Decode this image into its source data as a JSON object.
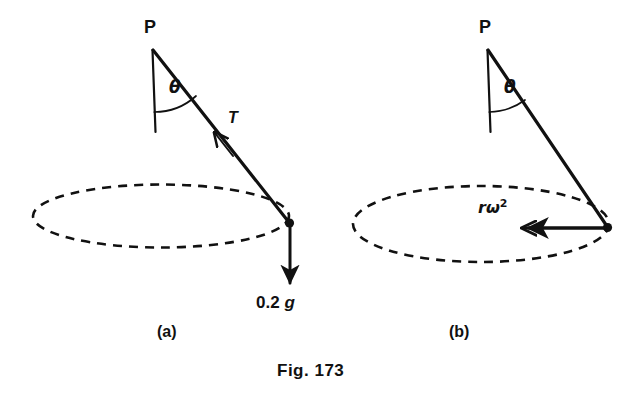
{
  "figure": {
    "caption": "Fig. 173",
    "background_color": "#ffffff",
    "ink_color": "#111111",
    "panels": [
      {
        "id": "a",
        "sub_caption": "(a)",
        "pivot_label": "P",
        "angle_label": "θ",
        "force_labels": [
          {
            "name": "tension",
            "text": "T",
            "direction": "up-left along string toward pivot"
          },
          {
            "name": "weight",
            "value": "0.2",
            "unit": "g",
            "direction": "vertically downward"
          }
        ],
        "circle_style": "dashed ellipse (horizontal circular path in perspective)"
      },
      {
        "id": "b",
        "sub_caption": "(b)",
        "pivot_label": "P",
        "angle_label": "θ",
        "force_labels": [
          {
            "name": "centripetal-acceleration",
            "base": "rω",
            "exponent": "2",
            "direction": "horizontally inward toward axis"
          }
        ],
        "circle_style": "dashed ellipse (horizontal circular path in perspective)"
      }
    ]
  }
}
